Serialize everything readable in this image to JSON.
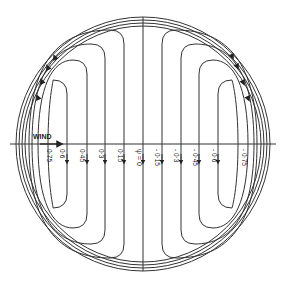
{
  "figure": {
    "type": "streamline-pattern",
    "wind_label": "WIND",
    "psi_label": "ψ = 0",
    "colors": {
      "ink": "#333333",
      "background": "#ffffff"
    },
    "contours_left": [
      {
        "value": 0.75,
        "label": "0·75"
      },
      {
        "value": 0.6,
        "label": "0·6"
      },
      {
        "value": 0.45,
        "label": "0·45"
      },
      {
        "value": 0.3,
        "label": "0·3"
      },
      {
        "value": 0.15,
        "label": "0·15"
      }
    ],
    "contours_right": [
      {
        "value": -0.15,
        "label": "- 0·15"
      },
      {
        "value": -0.3,
        "label": "- 0·3"
      },
      {
        "value": -0.45,
        "label": "- 0·45"
      },
      {
        "value": -0.6,
        "label": "- 0·6"
      },
      {
        "value": -0.75,
        "label": "- 0·75"
      }
    ],
    "flow_direction": {
      "along_axis": "downward",
      "left_outer_edge": "upward",
      "right_outer_edge": "downward"
    }
  }
}
